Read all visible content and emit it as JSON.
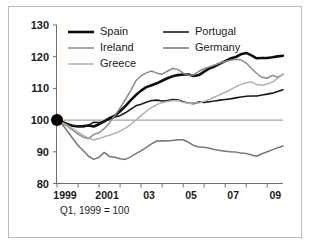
{
  "caption": "Q1, 1999 = 100",
  "legend": {
    "entries": [
      {
        "label": "Spain",
        "color": "#0d0d0d",
        "width": 2.6
      },
      {
        "label": "Portugal",
        "color": "#1a1a1a",
        "width": 1.6
      },
      {
        "label": "Ireland",
        "color": "#8a8a8a",
        "width": 1.5
      },
      {
        "label": "Germany",
        "color": "#767676",
        "width": 1.5
      },
      {
        "label": "Greece",
        "color": "#b0b0b0",
        "width": 1.5
      }
    ]
  },
  "chart_data": {
    "type": "line",
    "title": "",
    "subtitle": "Q1, 1999 = 100",
    "xlabel": "",
    "ylabel": "",
    "xlim": [
      1999,
      2009.75
    ],
    "ylim": [
      80,
      130
    ],
    "grid": false,
    "legend_position": "top-left-inside",
    "baseline": 100,
    "y_ticks": [
      80,
      90,
      100,
      110,
      120,
      130
    ],
    "y_tick_labels": [
      "80",
      "90",
      "100",
      "110",
      "120",
      "130"
    ],
    "x_ticks": [
      1999,
      2000,
      2001,
      2002,
      2003,
      2004,
      2005,
      2006,
      2007,
      2008,
      2009
    ],
    "x_tick_labels": [
      "1999",
      "",
      "2001",
      "",
      "03",
      "",
      "05",
      "",
      "07",
      "",
      "09"
    ],
    "x": [
      1999.0,
      1999.25,
      1999.5,
      1999.75,
      2000.0,
      2000.25,
      2000.5,
      2000.75,
      2001.0,
      2001.25,
      2001.5,
      2001.75,
      2002.0,
      2002.25,
      2002.5,
      2002.75,
      2003.0,
      2003.25,
      2003.5,
      2003.75,
      2004.0,
      2004.25,
      2004.5,
      2004.75,
      2005.0,
      2005.25,
      2005.5,
      2005.75,
      2006.0,
      2006.25,
      2006.5,
      2006.75,
      2007.0,
      2007.25,
      2007.5,
      2007.75,
      2008.0,
      2008.25,
      2008.5,
      2008.75,
      2009.0,
      2009.25,
      2009.5,
      2009.75
    ],
    "series": [
      {
        "name": "Spain",
        "color": "#0d0d0d",
        "width": 2.6,
        "values": [
          100.0,
          99.4,
          98.7,
          98.2,
          98.0,
          98.1,
          98.3,
          98.0,
          98.7,
          99.6,
          100.6,
          101.4,
          102.8,
          104.4,
          106.2,
          107.9,
          109.3,
          110.4,
          111.0,
          111.6,
          112.4,
          113.2,
          113.8,
          114.2,
          114.4,
          114.4,
          113.9,
          114.2,
          115.3,
          116.3,
          117.0,
          117.8,
          118.6,
          119.4,
          119.9,
          120.8,
          121.2,
          120.4,
          119.5,
          119.6,
          119.6,
          119.8,
          120.1,
          120.3
        ]
      },
      {
        "name": "Portugal",
        "color": "#1a1a1a",
        "width": 1.6,
        "values": [
          100.0,
          99.3,
          98.6,
          98.2,
          98.1,
          97.9,
          98.4,
          99.3,
          99.2,
          99.6,
          100.3,
          101.0,
          101.4,
          102.3,
          103.4,
          104.5,
          105.0,
          105.6,
          106.2,
          106.3,
          106.0,
          106.2,
          106.5,
          106.4,
          105.8,
          105.4,
          105.2,
          105.7,
          105.6,
          105.8,
          106.0,
          106.3,
          106.5,
          106.7,
          107.0,
          107.3,
          107.5,
          107.6,
          107.6,
          107.9,
          108.2,
          108.5,
          109.0,
          109.6
        ]
      },
      {
        "name": "Ireland",
        "color": "#8a8a8a",
        "width": 1.5,
        "values": [
          100.0,
          99.0,
          98.0,
          96.8,
          95.6,
          94.6,
          94.1,
          95.5,
          96.0,
          97.3,
          99.2,
          101.4,
          103.8,
          106.5,
          109.2,
          112.4,
          114.0,
          114.9,
          115.5,
          114.8,
          114.5,
          115.4,
          116.3,
          116.0,
          114.8,
          114.1,
          114.3,
          115.4,
          116.2,
          116.8,
          117.4,
          118.0,
          118.5,
          118.9,
          119.2,
          119.0,
          118.0,
          116.3,
          114.7,
          113.5,
          113.2,
          114.1,
          113.5,
          114.5
        ]
      },
      {
        "name": "Germany",
        "color": "#767676",
        "width": 1.5,
        "values": [
          100.0,
          98.6,
          96.5,
          94.2,
          92.0,
          90.3,
          88.6,
          87.6,
          88.3,
          89.8,
          88.5,
          88.3,
          87.8,
          87.6,
          88.4,
          89.4,
          90.3,
          91.4,
          92.5,
          93.4,
          93.5,
          93.4,
          93.6,
          93.8,
          93.8,
          93.0,
          92.0,
          91.5,
          91.4,
          91.1,
          90.7,
          90.4,
          90.2,
          90.0,
          89.9,
          89.6,
          89.5,
          89.0,
          88.6,
          89.4,
          90.0,
          90.6,
          91.3,
          91.8
        ]
      },
      {
        "name": "Greece",
        "color": "#b0b0b0",
        "width": 1.5,
        "values": [
          100.0,
          99.2,
          98.3,
          97.3,
          96.2,
          95.2,
          94.3,
          93.7,
          94.2,
          94.8,
          95.2,
          95.8,
          96.5,
          97.5,
          98.6,
          100.0,
          101.4,
          102.8,
          104.0,
          104.9,
          105.5,
          105.9,
          106.1,
          106.2,
          105.6,
          105.3,
          105.4,
          105.4,
          105.9,
          106.5,
          107.3,
          108.0,
          108.8,
          109.6,
          110.5,
          111.2,
          111.8,
          112.0,
          111.2,
          111.0,
          111.4,
          112.0,
          113.2,
          114.4
        ]
      }
    ],
    "marker": {
      "x": 1999.0,
      "y": 100.0,
      "color": "#000000",
      "radius": 6
    }
  }
}
